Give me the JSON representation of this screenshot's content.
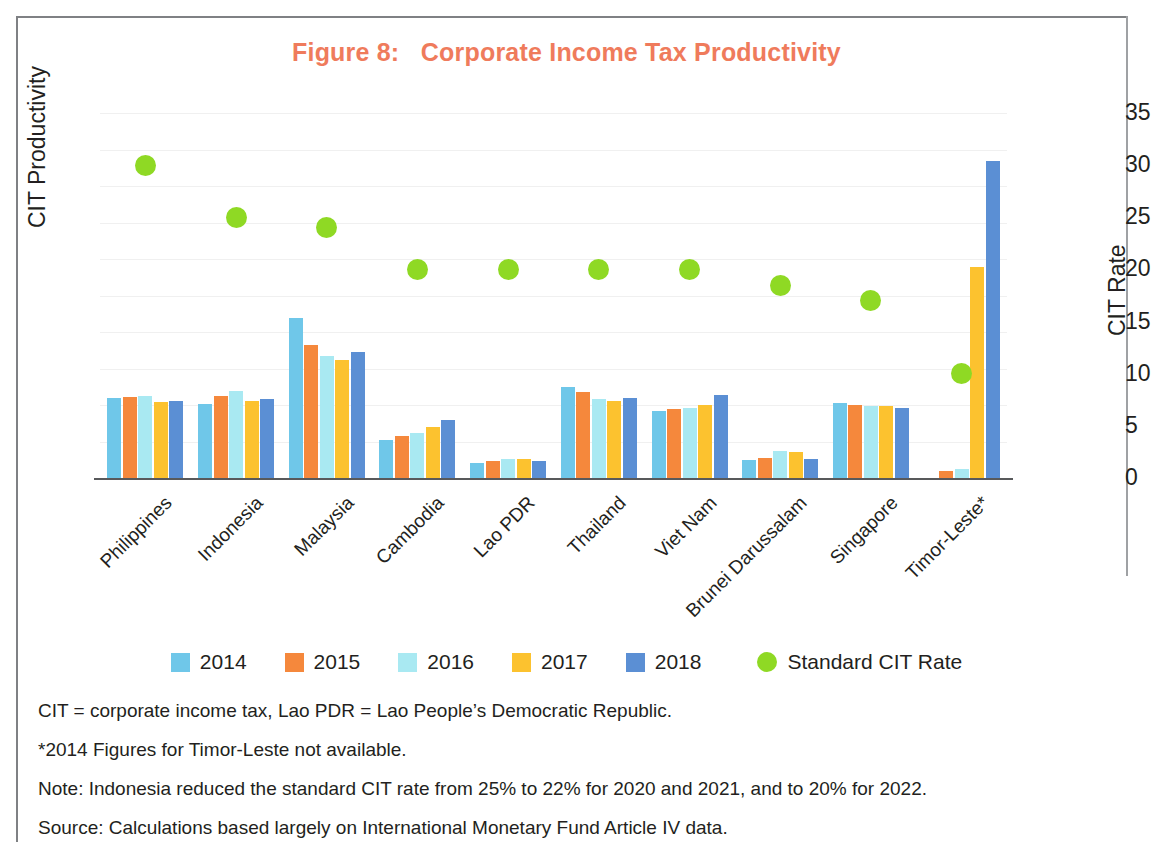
{
  "figure": {
    "title_prefix": "Figure 8:",
    "title_text": "Corporate Income Tax Productivity",
    "title_full": "Figure 8:   Corporate Income Tax Productivity",
    "title_color": "#ef7b5c"
  },
  "notes": [
    "CIT = corporate income tax, Lao PDR = Lao People’s Democratic Republic.",
    "*2014 Figures for Timor-Leste not available.",
    "Note: Indonesia reduced the standard CIT rate from 25% to 22% for 2020 and 2021, and to 20% for 2022.",
    "Source: Calculations based largely on International Monetary Fund Article IV data."
  ],
  "chart_data": {
    "type": "bar",
    "title": "Figure 8:   Corporate Income Tax Productivity",
    "xlabel": "",
    "ylabel": "CIT Productivity",
    "y2label": "CIT Rate",
    "ylim": [
      0,
      1
    ],
    "y2lim": [
      0,
      35
    ],
    "yticks": [
      "0",
      "0.1",
      "0.2",
      "0.3",
      "0.4",
      "0.5",
      "0.6",
      "0.7",
      "0.8",
      "0.9",
      "1"
    ],
    "ytick_values": [
      0,
      0.1,
      0.2,
      0.3,
      0.4,
      0.5,
      0.6,
      0.7,
      0.8,
      0.9,
      1
    ],
    "y2ticks": [
      "0",
      "5",
      "10",
      "15",
      "20",
      "25",
      "30",
      "35"
    ],
    "y2tick_values": [
      0,
      5,
      10,
      15,
      20,
      25,
      30,
      35
    ],
    "grid": true,
    "legend_position": "bottom",
    "categories": [
      "Philippines",
      "Indonesia",
      "Malaysia",
      "Cambodia",
      "Lao PDR",
      "Thailand",
      "Viet Nam",
      "Brunei Darussalam",
      "Singapore",
      "Timor-Leste*"
    ],
    "series": [
      {
        "name": "2014",
        "color": "#6fc7e9",
        "axis": "left",
        "values": [
          0.22,
          0.202,
          0.438,
          0.104,
          0.042,
          0.248,
          0.183,
          0.05,
          0.205,
          null
        ]
      },
      {
        "name": "2015",
        "color": "#f5883c",
        "axis": "left",
        "values": [
          0.222,
          0.224,
          0.364,
          0.114,
          0.046,
          0.236,
          0.19,
          0.055,
          0.2,
          0.018
        ]
      },
      {
        "name": "2016",
        "color": "#a9e9f2",
        "axis": "left",
        "values": [
          0.225,
          0.238,
          0.334,
          0.124,
          0.052,
          0.216,
          0.192,
          0.075,
          0.196,
          0.025
        ]
      },
      {
        "name": "2017",
        "color": "#fcc22f",
        "axis": "left",
        "values": [
          0.208,
          0.21,
          0.322,
          0.14,
          0.052,
          0.212,
          0.2,
          0.07,
          0.196,
          0.578
        ]
      },
      {
        "name": "2018",
        "color": "#5b8fd4",
        "axis": "left",
        "values": [
          0.21,
          0.216,
          0.345,
          0.16,
          0.046,
          0.218,
          0.228,
          0.052,
          0.193,
          0.868
        ]
      }
    ],
    "scatter_series": {
      "name": "Standard CIT Rate",
      "color": "#8fd924",
      "axis": "right",
      "values": [
        30.0,
        25.0,
        24.0,
        20.0,
        20.0,
        20.0,
        20.0,
        18.5,
        17.0,
        10.0
      ],
      "values_on_left_scale": [
        0.857,
        0.714,
        0.686,
        0.571,
        0.571,
        0.571,
        0.571,
        0.529,
        0.486,
        0.286
      ]
    }
  }
}
